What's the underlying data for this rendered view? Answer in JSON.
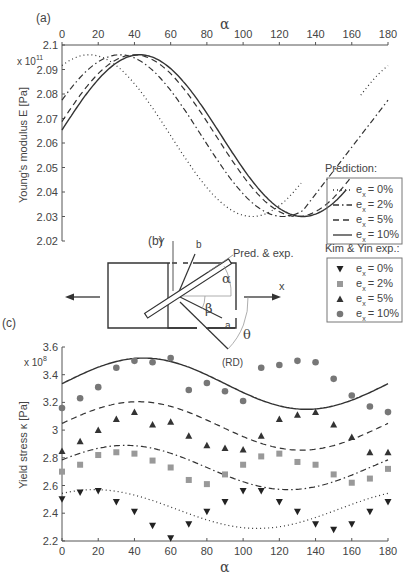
{
  "chart_data": [
    {
      "panel": "(a)",
      "type": "line",
      "title": "",
      "xlabel": "α",
      "ylabel": "Young's modulus E [Pa]",
      "y_multiplier": "x 10^11",
      "xlim": [
        0,
        180
      ],
      "ylim": [
        2.02,
        2.1
      ],
      "x_ticks": [
        0,
        20,
        40,
        60,
        80,
        100,
        120,
        140,
        160,
        180
      ],
      "y_ticks": [
        "2.02",
        "2.03",
        "2.04",
        "2.05",
        "2.06",
        "2.07",
        "2.08",
        "2.09",
        "2.1"
      ],
      "x_axis_position": "top",
      "grid": false,
      "legend_title": "Prediction:",
      "legend": [
        "e_x = 0%",
        "e_x = 2%",
        "e_x = 5%",
        "e_x = 10%"
      ],
      "series": [
        {
          "name": "e_x = 0%",
          "style": "dotted",
          "peak_alpha": [
            15,
            105
          ],
          "trough_alpha": [
            60,
            150
          ],
          "max": 2.096,
          "min": 2.03
        },
        {
          "name": "e_x = 2%",
          "style": "dash-dot",
          "peak_alpha": [
            32,
            122
          ],
          "trough_alpha": [
            77,
            167
          ],
          "max": 2.096,
          "min": 2.03
        },
        {
          "name": "e_x = 5%",
          "style": "dashed",
          "peak_alpha": [
            40,
            130
          ],
          "trough_alpha": [
            85,
            175
          ],
          "max": 2.096,
          "min": 2.03
        },
        {
          "name": "e_x = 10%",
          "style": "solid",
          "peak_alpha": [
            43,
            133
          ],
          "trough_alpha": [
            88,
            178
          ],
          "max": 2.096,
          "min": 2.03
        }
      ]
    },
    {
      "panel": "(c)",
      "type": "line",
      "title": "",
      "xlabel": "α",
      "ylabel": "Yield stress κ [Pa]",
      "y_multiplier": "x 10^8",
      "xlim": [
        0,
        180
      ],
      "ylim": [
        2.2,
        3.6
      ],
      "x_ticks": [
        0,
        20,
        40,
        60,
        80,
        100,
        120,
        140,
        160,
        180
      ],
      "y_ticks": [
        "2.2",
        "2.4",
        "2.6",
        "2.8",
        "3",
        "3.2",
        "3.4",
        "3.6"
      ],
      "grid": false,
      "legend_title": "Kim & Yin exp.:",
      "legend": [
        "e_x = 0%",
        "e_x = 2%",
        "e_x = 5%",
        "e_x = 10%"
      ],
      "x": [
        0,
        10,
        20,
        30,
        40,
        50,
        60,
        70,
        80,
        90,
        100,
        110,
        120,
        130,
        140,
        150,
        160,
        170,
        180
      ],
      "series": [
        {
          "name": "e_x = 0% (exp)",
          "marker": "triangle-down",
          "values": [
            2.5,
            2.55,
            2.56,
            2.48,
            2.41,
            2.31,
            2.22,
            2.32,
            2.41,
            2.48,
            2.56,
            2.56,
            2.48,
            2.41,
            2.32,
            2.28,
            2.32,
            2.41,
            2.48
          ]
        },
        {
          "name": "e_x = 2% (exp)",
          "marker": "square",
          "values": [
            2.7,
            2.75,
            2.82,
            2.84,
            2.83,
            2.78,
            2.73,
            2.64,
            2.61,
            2.68,
            2.75,
            2.81,
            2.83,
            2.77,
            2.75,
            2.68,
            2.62,
            2.65,
            2.72
          ]
        },
        {
          "name": "e_x = 5% (exp)",
          "marker": "triangle-up",
          "values": [
            2.85,
            2.92,
            3.0,
            3.08,
            3.13,
            3.04,
            3.06,
            2.96,
            2.89,
            2.87,
            2.86,
            2.96,
            3.08,
            3.11,
            3.13,
            3.04,
            2.95,
            2.84,
            2.84,
            2.84
          ]
        },
        {
          "name": "e_x = 10% (exp)",
          "marker": "circle",
          "values": [
            3.16,
            3.23,
            3.31,
            3.45,
            3.5,
            3.49,
            3.52,
            3.29,
            3.34,
            3.28,
            3.21,
            3.45,
            3.47,
            3.5,
            3.49,
            3.37,
            3.25,
            3.17,
            3.13
          ]
        },
        {
          "name": "e_x = 0% (pred)",
          "style": "dotted",
          "mean": 2.43,
          "amplitude": 0.14,
          "peak_alpha": 18
        },
        {
          "name": "e_x = 2% (pred)",
          "style": "dash-dot",
          "mean": 2.73,
          "amplitude": 0.16,
          "peak_alpha": 35
        },
        {
          "name": "e_x = 5% (pred)",
          "style": "dashed",
          "mean": 3.03,
          "amplitude": 0.175,
          "peak_alpha": 42
        },
        {
          "name": "e_x = 10% (pred)",
          "style": "solid",
          "mean": 3.335,
          "amplitude": 0.185,
          "peak_alpha": 45
        }
      ]
    }
  ],
  "labels": {
    "panel_a": "(a)",
    "panel_b": "(b)",
    "panel_c": "(c)",
    "alpha": "α",
    "y_label_a": "Young's modulus E [Pa]",
    "y_label_c": "Yield stress κ [Pa]",
    "exp_a": "x 10",
    "exp_a_sup": "11",
    "exp_c": "x 10",
    "exp_c_sup": "8",
    "legend_pred_title": "Prediction:",
    "legend_exp_title": "Kim & Yin exp.:",
    "legend_entries": [
      "= 0%",
      "= 2%",
      "= 5%",
      "= 10%"
    ],
    "e": "e",
    "x_sub": "x"
  },
  "diagram": {
    "Y": "Y",
    "b": "b",
    "a": "a",
    "x": "x",
    "pred_exp": "Pred. & exp.",
    "alpha": "α",
    "beta": "β",
    "theta": "θ",
    "rd": "(RD)"
  },
  "colors": {
    "line": "#333333",
    "axis": "#555555",
    "marker_0": "#222222",
    "marker_2": "#999999",
    "marker_5": "#333333",
    "marker_10": "#777777"
  }
}
